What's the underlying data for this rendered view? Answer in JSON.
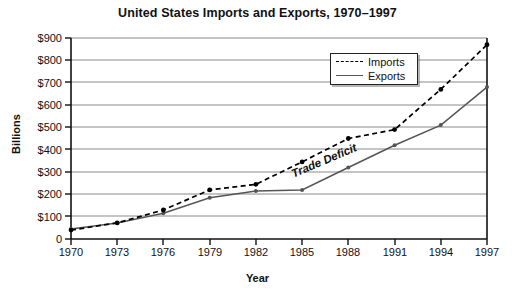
{
  "chart_data": {
    "type": "line",
    "title": "United States Imports and Exports, 1970–1997",
    "xlabel": "Year",
    "ylabel": "Billions",
    "grid": true,
    "legend_position": "top-right",
    "categories": [
      1970,
      1973,
      1976,
      1979,
      1982,
      1985,
      1988,
      1991,
      1994,
      1997
    ],
    "xtick_labels": [
      "1970",
      "1973",
      "1976",
      "1979",
      "1982",
      "1985",
      "1988",
      "1991",
      "1994",
      "1997"
    ],
    "ytick_labels": [
      "$900",
      "$800",
      "$700",
      "$600",
      "$500",
      "$400",
      "$300",
      "$200",
      "$100",
      "0"
    ],
    "ytick_values": [
      900,
      800,
      700,
      600,
      500,
      400,
      300,
      200,
      100,
      0
    ],
    "ylim": [
      0,
      900
    ],
    "xlim": [
      1970,
      1997
    ],
    "series": [
      {
        "name": "Imports",
        "style": "dashed",
        "color": "#000000",
        "values": [
          40,
          72,
          130,
          220,
          245,
          345,
          450,
          490,
          670,
          870
        ]
      },
      {
        "name": "Exports",
        "style": "solid",
        "color": "#555555",
        "values": [
          45,
          72,
          115,
          185,
          215,
          220,
          320,
          420,
          510,
          680
        ]
      }
    ],
    "annotations": [
      {
        "text": "Trade Deficit",
        "rotation": -23
      }
    ]
  },
  "legend": {
    "items": [
      {
        "label": "Imports",
        "key": "dashed-line-key"
      },
      {
        "label": "Exports",
        "key": "solid-line-key"
      }
    ]
  }
}
